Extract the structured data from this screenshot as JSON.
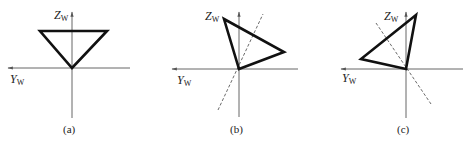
{
  "figure": {
    "panels": [
      {
        "id": "a",
        "caption": "(a)",
        "z_label": "Z",
        "z_sub": "W",
        "y_label": "Y",
        "y_sub": "W",
        "triangle": "40,31 107,31 72,68",
        "dashed_line": null
      },
      {
        "id": "b",
        "caption": "(b)",
        "z_label": "Z",
        "z_sub": "W",
        "y_label": "Y",
        "y_sub": "W",
        "triangle": "224,19 284,52 239,69",
        "dashed_line": "218,110 263,14"
      },
      {
        "id": "c",
        "caption": "(c)",
        "z_label": "Z",
        "z_sub": "W",
        "y_label": "Y",
        "y_sub": "W",
        "triangle": "416,15 361,59 406,69",
        "dashed_line": "376,23 431,104"
      }
    ]
  }
}
